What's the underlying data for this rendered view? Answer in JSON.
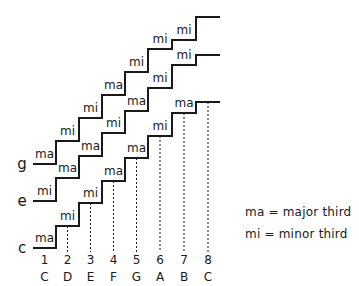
{
  "diagram": {
    "staircases": [
      {
        "root": "c",
        "label_y": 248,
        "levels": [
          248,
          226,
          203,
          181,
          158,
          136,
          113,
          102
        ],
        "intervals": [
          "ma",
          "mi",
          "mi",
          "ma",
          "ma",
          "mi",
          "ma"
        ]
      },
      {
        "root": "e",
        "label_y": 201,
        "levels": [
          201,
          178,
          156,
          133,
          111,
          88,
          65,
          55
        ],
        "intervals": [
          "mi",
          "ma",
          "ma",
          "mi",
          "ma",
          "mi",
          "mi"
        ]
      },
      {
        "root": "g",
        "label_y": 164,
        "levels": [
          164,
          141,
          118,
          95,
          72,
          49,
          40,
          17
        ],
        "intervals": [
          "ma",
          "mi",
          "mi",
          "ma",
          "mi",
          "mi",
          "mi"
        ]
      }
    ],
    "column_edges": [
      33,
      56,
      79,
      102,
      125,
      148,
      172,
      196,
      220
    ],
    "degree_numbers": [
      "1",
      "2",
      "3",
      "4",
      "5",
      "6",
      "7",
      "8"
    ],
    "note_names": [
      "C",
      "D",
      "E",
      "F",
      "G",
      "A",
      "B",
      "C"
    ],
    "row_labels": [
      "g",
      "e",
      "c"
    ]
  },
  "legend": {
    "major": "ma = major third",
    "minor": "mi = minor third"
  }
}
